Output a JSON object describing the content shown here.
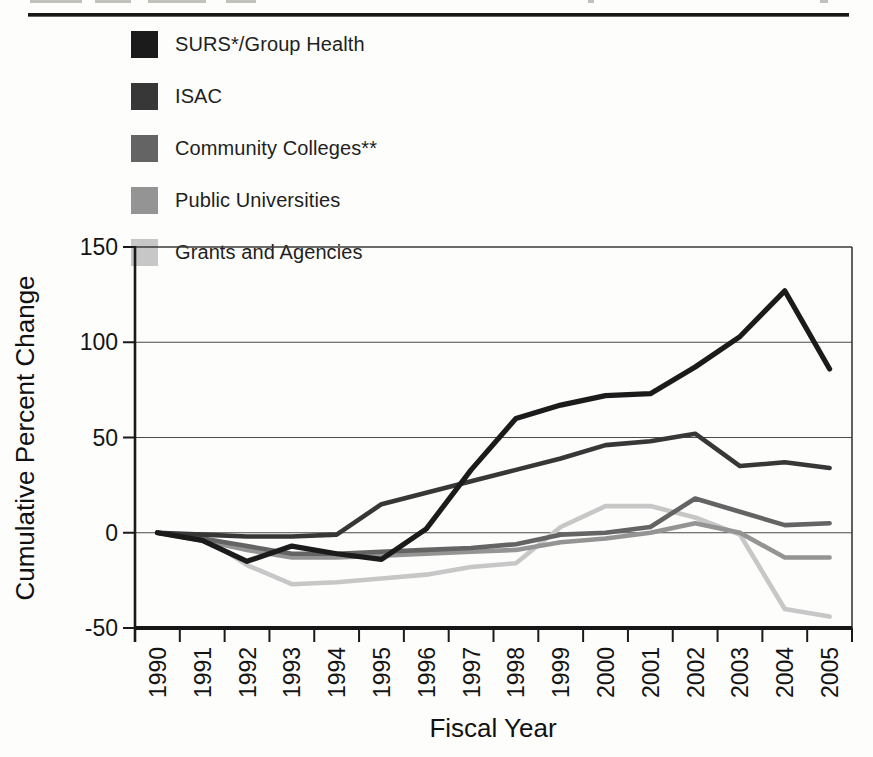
{
  "legend": {
    "position": "top-left"
  },
  "chart_data": {
    "type": "line",
    "x": [
      "1990",
      "1991",
      "1992",
      "1993",
      "1994",
      "1995",
      "1996",
      "1997",
      "1998",
      "1999",
      "2000",
      "2001",
      "2002",
      "2003",
      "2004",
      "2005"
    ],
    "series": [
      {
        "name": "SURS*/Group Health",
        "color": "#1b1b1b",
        "values": [
          0,
          -4,
          -15,
          -7,
          -11,
          -14,
          2,
          33,
          60,
          67,
          72,
          73,
          87,
          103,
          127,
          86
        ]
      },
      {
        "name": "ISAC",
        "color": "#373737",
        "values": [
          0,
          -1,
          -2,
          -2,
          -1,
          15,
          21,
          27,
          33,
          39,
          46,
          48,
          52,
          35,
          37,
          34
        ]
      },
      {
        "name": "Community Colleges**",
        "color": "#646464",
        "values": [
          0,
          -3,
          -7,
          -11,
          -11,
          -10,
          -9,
          -8,
          -6,
          -1,
          0,
          3,
          18,
          11,
          4,
          5
        ]
      },
      {
        "name": "Public Universities",
        "color": "#949494",
        "values": [
          0,
          -4,
          -9,
          -13,
          -13,
          -12,
          -11,
          -10,
          -9,
          -5,
          -3,
          0,
          5,
          0,
          -13,
          -13
        ]
      },
      {
        "name": "Grants and Agencies",
        "color": "#c7c7c7",
        "values": [
          0,
          -2,
          -17,
          -27,
          -26,
          -24,
          -22,
          -18,
          -16,
          3,
          14,
          14,
          8,
          -1,
          -40,
          -44
        ]
      }
    ],
    "xlabel": "Fiscal Year",
    "ylabel": "Cumulative Percent Change",
    "yticks": [
      150,
      100,
      50,
      0,
      -50
    ],
    "ylim": [
      -50,
      150
    ],
    "grid": "horizontal-only",
    "legend_position": "top-left"
  }
}
